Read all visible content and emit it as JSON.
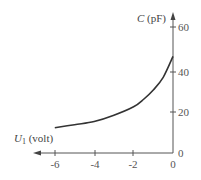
{
  "chart_data": {
    "type": "line",
    "title": "",
    "xlabel": "U1 (volt)",
    "ylabel": "C (pF)",
    "x_ticks": [
      "-6",
      "-4",
      "-2",
      "0"
    ],
    "y_ticks": [
      "0",
      "20",
      "40",
      "60"
    ],
    "xlim": [
      -7,
      0
    ],
    "ylim": [
      0,
      62
    ],
    "grid": false,
    "legend": "none",
    "series": [
      {
        "name": "C vs U1",
        "x": [
          -6,
          -5,
          -4,
          -3,
          -2,
          -1.5,
          -1,
          -0.5,
          0
        ],
        "y": [
          12,
          13.5,
          15,
          18,
          22,
          25.5,
          30,
          36,
          46
        ]
      }
    ]
  },
  "labels": {
    "y_axis_var": "C",
    "y_axis_unit": "(pF)",
    "x_axis_var": "U",
    "x_axis_sub": "1",
    "x_axis_unit": "(volt)"
  },
  "colors": {
    "curve": "#333333",
    "axis": "#555555"
  }
}
